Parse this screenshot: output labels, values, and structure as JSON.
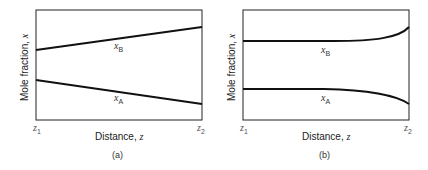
{
  "panels": [
    {
      "id": "a",
      "caption": "(a)",
      "ylabel": "Mole fraction, ",
      "ylabel_var": "x",
      "xlabel": "Distance, ",
      "xlabel_var": "z",
      "x_ticks": [
        {
          "var": "z",
          "sub": "1"
        },
        {
          "var": "z",
          "sub": "2"
        }
      ],
      "curves": [
        {
          "var": "x",
          "sub": "B",
          "shape": "linear increasing"
        },
        {
          "var": "x",
          "sub": "A",
          "shape": "linear decreasing"
        }
      ]
    },
    {
      "id": "b",
      "caption": "(b)",
      "ylabel": "Mole fraction, ",
      "ylabel_var": "x",
      "xlabel": "Distance, ",
      "xlabel_var": "z",
      "x_ticks": [
        {
          "var": "z",
          "sub": "1"
        },
        {
          "var": "z",
          "sub": "2"
        }
      ],
      "curves": [
        {
          "var": "x",
          "sub": "B",
          "shape": "flat then curving upward near z2"
        },
        {
          "var": "x",
          "sub": "A",
          "shape": "flat then curving downward near z2"
        }
      ]
    }
  ],
  "colors": {
    "line": "#111111",
    "frame": "#222222"
  }
}
